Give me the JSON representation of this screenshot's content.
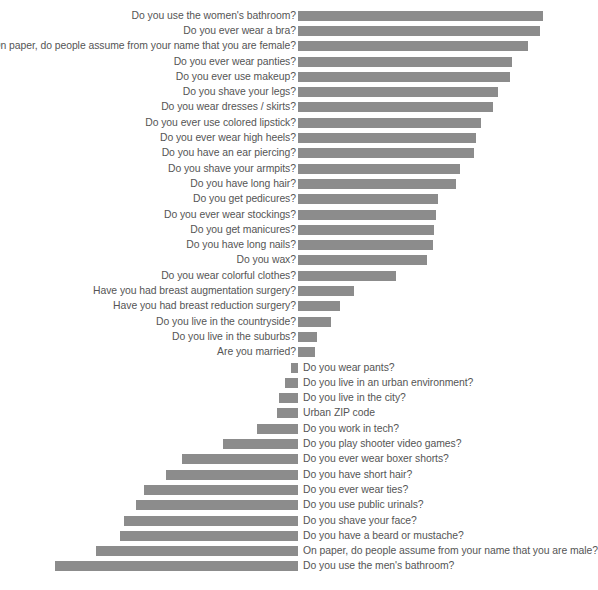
{
  "chart_data": {
    "type": "bar",
    "title": "",
    "subtitle": "",
    "xlabel": "",
    "ylabel": "",
    "orientation": "horizontal",
    "layout": "diverging-two-group",
    "grid": false,
    "legend": "none",
    "axis_x_px": 298,
    "bar_color": "#8c8c8c",
    "text_color": "#555555",
    "value_unit": "relative bar length (px)",
    "xlim": [
      0,
      250
    ],
    "groups": [
      {
        "name": "feminine-coded-questions",
        "direction": "right",
        "label_side": "left",
        "categories": [
          "Do you use the women's bathroom?",
          "Do you ever wear a bra?",
          "On paper, do people assume from your name that you are female?",
          "Do you ever wear panties?",
          "Do you ever use makeup?",
          "Do you shave your legs?",
          "Do you wear dresses / skirts?",
          "Do you ever use colored lipstick?",
          "Do you ever wear high heels?",
          "Do you have an ear piercing?",
          "Do you shave your armpits?",
          "Do you have long hair?",
          "Do you get pedicures?",
          "Do you ever wear stockings?",
          "Do you get manicures?",
          "Do you have long nails?",
          "Do you wax?",
          "Do you wear colorful clothes?",
          "Have you had breast augmentation surgery?",
          "Have you had breast reduction surgery?",
          "Do you live in the countryside?",
          "Do you live in the suburbs?",
          "Are you married?"
        ],
        "values": [
          245,
          242,
          230,
          214,
          212,
          200,
          195,
          183,
          178,
          176,
          162,
          158,
          140,
          138,
          136,
          135,
          129,
          98,
          56,
          42,
          33,
          19,
          17
        ]
      },
      {
        "name": "masculine-coded-questions",
        "direction": "left",
        "label_side": "right",
        "categories": [
          "Do you wear pants?",
          "Do you live in an urban environment?",
          "Do you live in the city?",
          "Urban ZIP code",
          "Do you work in tech?",
          "Do you play shooter video games?",
          "Do you ever wear boxer shorts?",
          "Do you have short hair?",
          "Do you ever wear ties?",
          "Do you use public urinals?",
          "Do you shave your face?",
          "Do you have a beard or mustache?",
          "On paper, do people assume from your name that you are male?",
          "Do you use the men's bathroom?"
        ],
        "values": [
          7,
          13,
          19,
          21,
          41,
          75,
          116,
          132,
          154,
          162,
          174,
          178,
          202,
          243
        ]
      }
    ]
  }
}
